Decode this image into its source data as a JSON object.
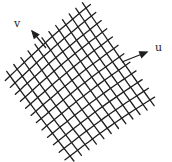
{
  "diagram": {
    "line_color": "#1e1e1e",
    "labels": {
      "u": "u",
      "v": "v"
    },
    "axes": [
      {
        "name": "u",
        "arrow_from": [
          122,
          62
        ],
        "arrow_to": [
          147,
          52
        ]
      },
      {
        "name": "v",
        "arrow_from": [
          46,
          48
        ],
        "arrow_to": [
          32,
          31
        ]
      }
    ],
    "grid": {
      "corner_top": [
        86,
        8
      ],
      "corner_right": [
        150,
        100
      ],
      "corner_bottom": [
        70,
        156
      ],
      "corner_left": [
        10,
        76
      ],
      "u_line_count": 12,
      "v_line_count": 12,
      "bulge": 5
    }
  }
}
